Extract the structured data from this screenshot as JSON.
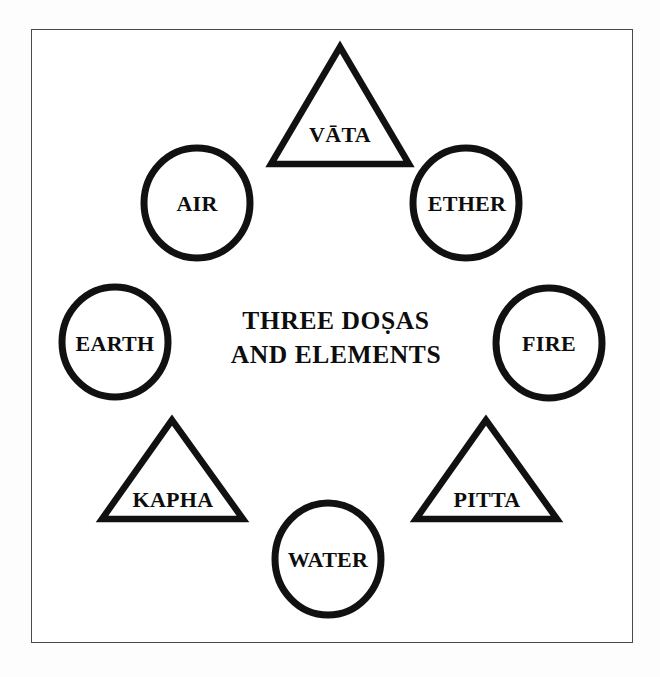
{
  "figure": {
    "title_line_1": "THREE DOṢAS",
    "title_line_2": "AND ELEMENTS",
    "stroke_color": "#111111",
    "fill_color": "#ffffff",
    "frame_color": "#4a4a4a",
    "background_color": "#ffffff"
  },
  "doshas": [
    {
      "id": "vata",
      "label": "VĀTA",
      "shape": "triangle",
      "position": "top",
      "apex": [
        340,
        47
      ],
      "base_left": [
        271,
        164
      ],
      "base_right": [
        409,
        164
      ],
      "label_point": [
        340,
        135
      ]
    },
    {
      "id": "kapha",
      "label": "KAPHA",
      "shape": "triangle",
      "position": "bottom-left",
      "apex": [
        172,
        420
      ],
      "base_left": [
        102,
        519
      ],
      "base_right": [
        243,
        519
      ],
      "label_point": [
        173,
        500
      ]
    },
    {
      "id": "pitta",
      "label": "PITTA",
      "shape": "triangle",
      "position": "bottom-right",
      "apex": [
        486,
        420
      ],
      "base_left": [
        416,
        519
      ],
      "base_right": [
        557,
        519
      ],
      "label_point": [
        487,
        500
      ]
    }
  ],
  "elements": [
    {
      "id": "air",
      "label": "AIR",
      "shape": "circle",
      "position": "upper-left",
      "center": [
        197,
        203
      ],
      "radius_x": 53,
      "radius_y": 55
    },
    {
      "id": "ether",
      "label": "ETHER",
      "shape": "circle",
      "position": "upper-right",
      "center": [
        466,
        203
      ],
      "radius_x": 53,
      "radius_y": 55
    },
    {
      "id": "earth",
      "label": "EARTH",
      "shape": "circle",
      "position": "left",
      "center": [
        115,
        342
      ],
      "radius_x": 53,
      "radius_y": 55
    },
    {
      "id": "fire",
      "label": "FIRE",
      "shape": "circle",
      "position": "right",
      "center": [
        549,
        343
      ],
      "radius_x": 53,
      "radius_y": 55
    },
    {
      "id": "water",
      "label": "WATER",
      "shape": "circle",
      "position": "bottom",
      "center": [
        328,
        559
      ],
      "radius_x": 53,
      "radius_y": 56
    }
  ]
}
